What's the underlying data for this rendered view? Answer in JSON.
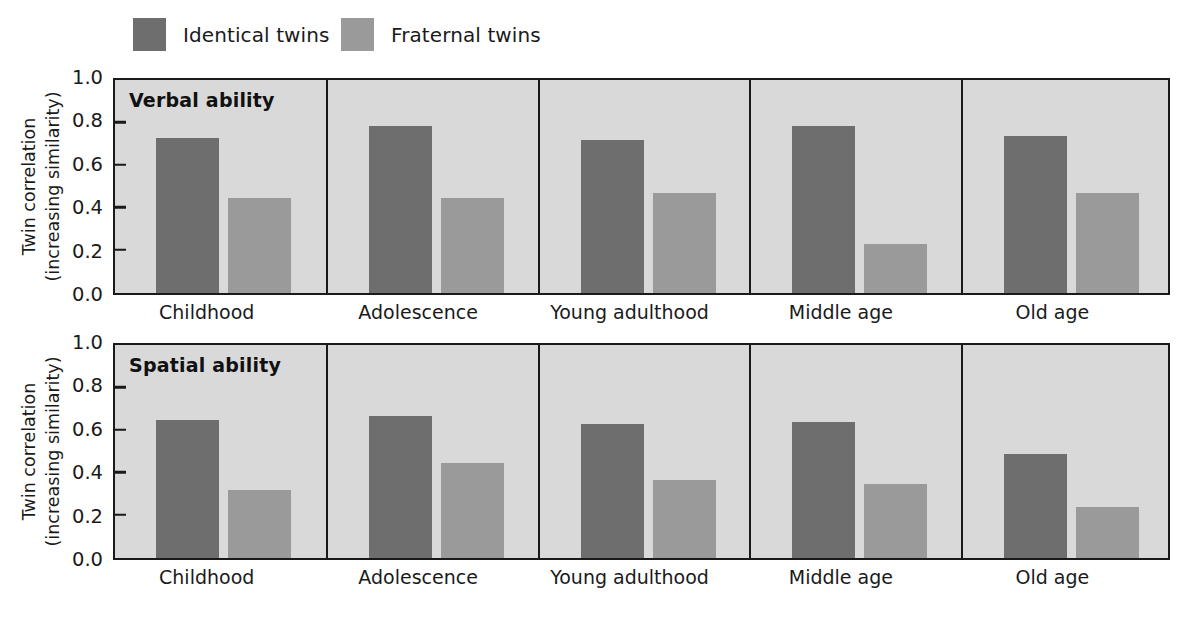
{
  "legend": {
    "items": [
      {
        "label": "Identical twins",
        "color": "#6e6e6e",
        "icon": "legend-swatch-icon"
      },
      {
        "label": "Fraternal twins",
        "color": "#9a9a9a",
        "icon": "legend-swatch-icon"
      }
    ]
  },
  "axis": {
    "ylabel_line1": "Twin correlation",
    "ylabel_line2": "(increasing similarity)",
    "ticks": [
      "1.0",
      "0.8",
      "0.6",
      "0.4",
      "0.2",
      "0.0"
    ]
  },
  "panels": [
    {
      "title": "Verbal ability"
    },
    {
      "title": "Spatial ability"
    }
  ],
  "chart_data": [
    {
      "type": "bar",
      "title": "Verbal ability",
      "categories": [
        "Childhood",
        "Adolescence",
        "Young adulthood",
        "Middle age",
        "Old age"
      ],
      "series": [
        {
          "name": "Identical twins",
          "color": "#6e6e6e",
          "values": [
            0.73,
            0.79,
            0.72,
            0.79,
            0.74
          ]
        },
        {
          "name": "Fraternal twins",
          "color": "#9a9a9a",
          "values": [
            0.45,
            0.45,
            0.47,
            0.23,
            0.47
          ]
        }
      ],
      "xlabel": "",
      "ylabel": "Twin correlation (increasing similarity)",
      "ylim": [
        0.0,
        1.0
      ],
      "yticks": [
        0.0,
        0.2,
        0.4,
        0.6,
        0.8,
        1.0
      ],
      "grid": false,
      "legend_position": "top"
    },
    {
      "type": "bar",
      "title": "Spatial ability",
      "categories": [
        "Childhood",
        "Adolescence",
        "Young adulthood",
        "Middle age",
        "Old age"
      ],
      "series": [
        {
          "name": "Identical twins",
          "color": "#6e6e6e",
          "values": [
            0.65,
            0.67,
            0.63,
            0.64,
            0.49
          ]
        },
        {
          "name": "Fraternal twins",
          "color": "#9a9a9a",
          "values": [
            0.32,
            0.45,
            0.37,
            0.35,
            0.24
          ]
        }
      ],
      "xlabel": "",
      "ylabel": "Twin correlation (increasing similarity)",
      "ylim": [
        0.0,
        1.0
      ],
      "yticks": [
        0.0,
        0.2,
        0.4,
        0.6,
        0.8,
        1.0
      ],
      "grid": false,
      "legend_position": "top"
    }
  ]
}
